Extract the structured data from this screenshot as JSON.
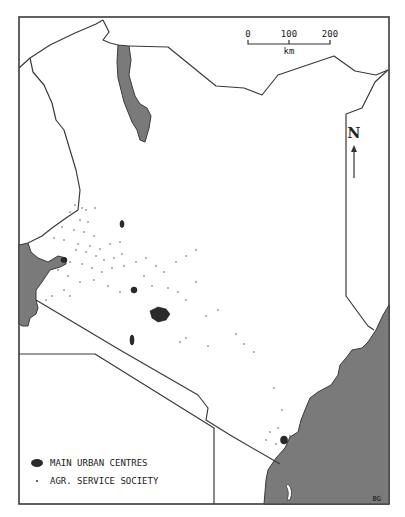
{
  "map": {
    "subject": "Kenya",
    "scale_bar": {
      "ticks": [
        "0",
        "100",
        "200"
      ],
      "unit": "km"
    },
    "north_arrow": {
      "label": "N"
    },
    "legend": {
      "items": [
        {
          "symbol": "filled-blob",
          "label": "MAIN URBAN CENTRES"
        },
        {
          "symbol": "small-dot",
          "label": "AGR. SERVICE SOCIETY"
        }
      ]
    },
    "credit": "BG",
    "colors": {
      "water": "#7a7a7a",
      "urban": "#2a2a2a",
      "border": "#3a3a3a",
      "land": "#ffffff"
    }
  }
}
